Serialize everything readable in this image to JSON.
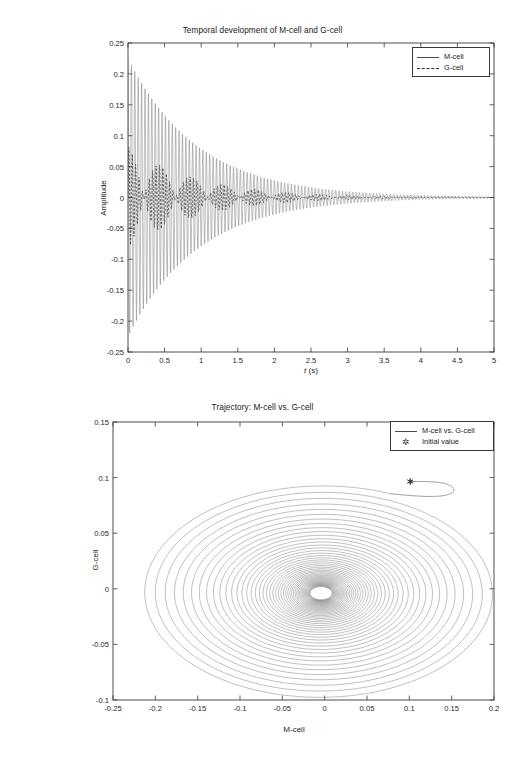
{
  "figure": {
    "background": "#ffffff",
    "width": 525,
    "height": 758
  },
  "chart_data": [
    {
      "id": "temporal",
      "type": "line",
      "title": "Temporal development of M-cell and G-cell",
      "xlabel": "t (s)",
      "ylabel": "Amplitude",
      "xlim": [
        0,
        5
      ],
      "ylim": [
        -0.25,
        0.25
      ],
      "xticks": [
        0,
        0.5,
        1,
        1.5,
        2,
        2.5,
        3,
        3.5,
        4,
        4.5,
        5
      ],
      "xticklabels": [
        "0",
        "0.5",
        "1",
        "1.5",
        "2",
        "2.5",
        "3",
        "3.5",
        "4",
        "4.5",
        "5"
      ],
      "yticks": [
        -0.25,
        -0.2,
        -0.15,
        -0.1,
        -0.05,
        0,
        0.05,
        0.1,
        0.15,
        0.2,
        0.25
      ],
      "yticklabels": [
        "-0.25",
        "-0.2",
        "-0.15",
        "-0.1",
        "-0.05",
        "0",
        "0.05",
        "0.1",
        "0.15",
        "0.2",
        "0.25"
      ],
      "grid": false,
      "legend_position": "upper right",
      "series": [
        {
          "name": "M-cell",
          "style": "solid",
          "color": "#6d6d6d",
          "model": "damped-oscillation",
          "amplitude": 0.225,
          "decay": 1.05,
          "frequency_hz": 21.5,
          "phase": 1.5708,
          "beat_hz": 0,
          "offset": 0
        },
        {
          "name": "G-cell",
          "style": "dashed",
          "color": "#2a2a2a",
          "model": "damped-oscillation",
          "amplitude": 0.082,
          "decay": 1.05,
          "frequency_hz": 21.5,
          "phase": 0,
          "beat_hz": 1.15,
          "offset": 0
        }
      ]
    },
    {
      "id": "trajectory",
      "type": "line",
      "title": "Trajectory: M-cell vs. G-cell",
      "xlabel": "M-cell",
      "ylabel": "G-cell",
      "xlim": [
        -0.25,
        0.2
      ],
      "ylim": [
        -0.1,
        0.15
      ],
      "xticks": [
        -0.25,
        -0.2,
        -0.15,
        -0.1,
        -0.05,
        0,
        0.05,
        0.1,
        0.15,
        0.2
      ],
      "xticklabels": [
        "-0.25",
        "-0.2",
        "-0.15",
        "-0.1",
        "-0.05",
        "0",
        "0.05",
        "0.1",
        "0.15",
        "0.2"
      ],
      "yticks": [
        -0.1,
        -0.05,
        0,
        0.05,
        0.1,
        0.15
      ],
      "yticklabels": [
        "-0.1",
        "-0.05",
        "0",
        "0.05",
        "0.1",
        "0.15"
      ],
      "grid": false,
      "legend_position": "upper right",
      "series": [
        {
          "name": "M-cell vs. G-cell",
          "style": "solid",
          "color": "#5a5a5a",
          "model": "spiral",
          "center": [
            -0.004,
            -0.004
          ],
          "rx_start": 0.215,
          "ry_start": 0.098,
          "decay": 0.0098,
          "turns": 46
        }
      ],
      "markers": [
        {
          "name": "Initial value",
          "marker": "asterisk",
          "color": "#2b2b2b",
          "x": 0.101,
          "y": 0.0965
        }
      ]
    }
  ],
  "top_chart": {
    "title": "Temporal development of M-cell and G-cell",
    "xlabel_pre": "t",
    "xlabel_post": " (s)",
    "ylabel": "Amplitude",
    "legend": [
      {
        "label": "M-cell",
        "style": "solid"
      },
      {
        "label": "G-cell",
        "style": "dashed"
      }
    ]
  },
  "bottom_chart": {
    "title": "Trajectory: M-cell vs. G-cell",
    "xlabel": "M-cell",
    "ylabel": "G-cell",
    "legend": [
      {
        "label": "M-cell vs. G-cell",
        "style": "solid"
      },
      {
        "label": "Initial value",
        "style": "marker",
        "glyph": "✲"
      }
    ]
  }
}
